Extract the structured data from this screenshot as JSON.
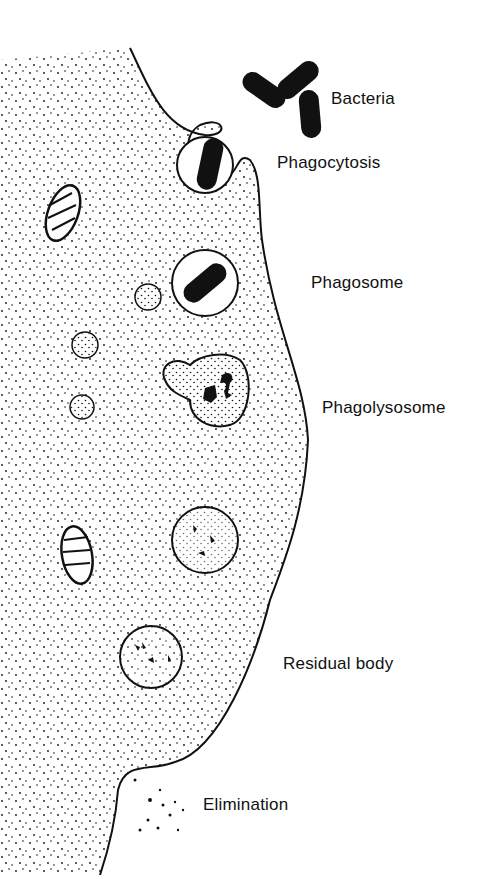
{
  "diagram": {
    "labels": {
      "bacteria": "Bacteria",
      "phagocytosis": "Phagocytosis",
      "phagosome": "Phagosome",
      "phagolysosome": "Phagolysosome",
      "residual_body": "Residual body",
      "elimination": "Elimination"
    },
    "colors": {
      "ink": "#111111",
      "background": "#ffffff"
    }
  }
}
